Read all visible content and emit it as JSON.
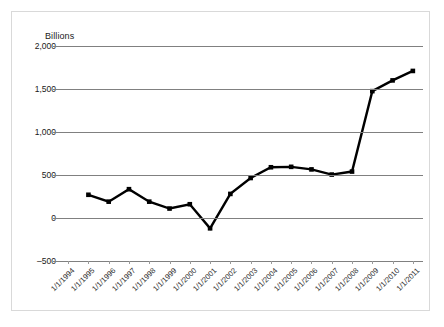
{
  "chart_data": {
    "type": "line",
    "title": "",
    "subtitle": "",
    "axis_title": "Billions",
    "xlabel": "",
    "ylabel": "Billions",
    "grid": true,
    "legend": "none",
    "ylim": [
      -500,
      2000
    ],
    "ytick_labels": [
      "2,000",
      "1,500",
      "1,000",
      "500",
      "0",
      "–500"
    ],
    "ytick_values": [
      2000,
      1500,
      1000,
      500,
      0,
      -500
    ],
    "categories": [
      "1/1/1994",
      "1/1/1995",
      "1/1/1996",
      "1/1/1997",
      "1/1/1998",
      "1/1/1999",
      "1/1/2000",
      "1/1/2001",
      "1/1/2002",
      "1/1/2003",
      "1/1/2004",
      "1/1/2005",
      "1/1/2006",
      "1/1/2007",
      "1/1/2008",
      "1/1/2009",
      "1/1/2010",
      "1/1/2011"
    ],
    "values": [
      null,
      270,
      190,
      335,
      190,
      110,
      160,
      -120,
      280,
      465,
      590,
      595,
      565,
      505,
      540,
      1475,
      1600,
      1710
    ],
    "series_color": "#000000",
    "grid_color": "#808080",
    "marker": "square"
  }
}
